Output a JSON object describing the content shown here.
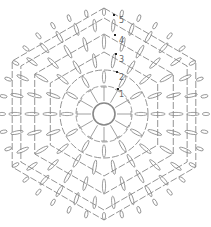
{
  "round_labels": [
    "1",
    "2",
    "3",
    "4",
    "5"
  ],
  "colors": {
    "stroke": "#888888",
    "marker": "#222222",
    "label": "#666666"
  },
  "stitches": {
    "center": "magic-ring",
    "round_1": {
      "type": "double-crochet",
      "count": 12
    },
    "round_2": {
      "type": "dc-cluster-with-chain-arcs"
    },
    "round_3": {
      "type": "dc-cluster-with-chain-arcs"
    },
    "round_4": {
      "type": "dc-cluster-with-chain-arcs"
    },
    "round_5": {
      "type": "dc-cluster-with-chain-arcs"
    }
  }
}
